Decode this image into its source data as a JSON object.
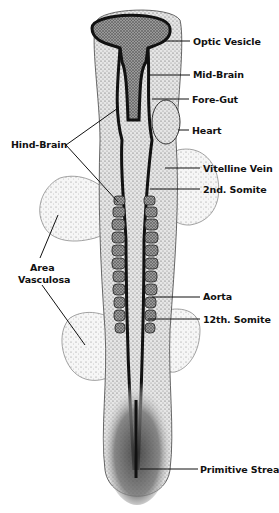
{
  "figure": {
    "labels_right": [
      {
        "id": "optic-vesicle",
        "text": "Optic Vesicle",
        "x": 193,
        "y": 36
      },
      {
        "id": "mid-brain",
        "text": "Mid-Brain",
        "x": 193,
        "y": 69
      },
      {
        "id": "fore-gut",
        "text": "Fore-Gut",
        "x": 192,
        "y": 94
      },
      {
        "id": "heart",
        "text": "Heart",
        "x": 192,
        "y": 125
      },
      {
        "id": "vitelline-vein",
        "text": "Vitelline Vein",
        "x": 203,
        "y": 165
      },
      {
        "id": "second-somite",
        "text": "2nd. Somite",
        "x": 203,
        "y": 185
      },
      {
        "id": "aorta",
        "text": "Aorta",
        "x": 203,
        "y": 292
      },
      {
        "id": "twelfth-somite",
        "text": "12th. Somite",
        "x": 203,
        "y": 315
      },
      {
        "id": "primitive-streak",
        "text": "Primitive Streak",
        "x": 200,
        "y": 465
      }
    ],
    "labels_left": [
      {
        "id": "hind-brain",
        "text": "Hind-Brain",
        "x": 11,
        "y": 139
      },
      {
        "id": "area-vasculosa-1",
        "text": "Area",
        "x": 30,
        "y": 262
      },
      {
        "id": "area-vasculosa-2",
        "text": "Vasculosa",
        "x": 18,
        "y": 274
      }
    ],
    "colors": {
      "ink": "#111111",
      "stipple_light": "#d8d8d8",
      "stipple_mid": "#9a9a9a",
      "stipple_dark": "#555555",
      "background": "#ffffff"
    }
  }
}
